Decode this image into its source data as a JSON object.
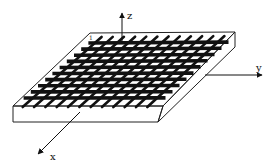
{
  "figure": {
    "axes": {
      "x": {
        "label": "x"
      },
      "y": {
        "label": "y"
      },
      "z": {
        "label": "z"
      }
    },
    "corner_marker": {
      "label": "1"
    },
    "grid": {
      "rows": 10,
      "columns": 12
    },
    "colors": {
      "background": "#ffffff",
      "ink": "#111111",
      "slab_edge": "#222222"
    }
  }
}
